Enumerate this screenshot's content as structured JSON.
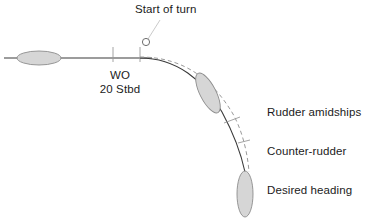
{
  "diagram": {
    "title_label": "Start of turn",
    "wo_label_line1": "WO",
    "wo_label_line2": "20 Stbd",
    "rudder_amidships_label": "Rudder amidships",
    "counter_rudder_label": "Counter-rudder",
    "desired_heading_label": "Desired heading",
    "colors": {
      "line": "#3a3a3a",
      "hull_fill": "#d6d6d6",
      "hull_stroke": "#8c8c8c",
      "dashed": "#9a9a9a",
      "tick": "#9a9a9a",
      "text": "#1b1b1b",
      "background": "#ffffff"
    },
    "elements": {
      "ship_initial": "ship-hull-initial",
      "ship_midturn": "ship-hull-midturn",
      "ship_final": "ship-hull-final",
      "start_marker": "start-of-turn-circle",
      "track_solid": "planned-track",
      "track_dashed": "actual-track"
    }
  }
}
